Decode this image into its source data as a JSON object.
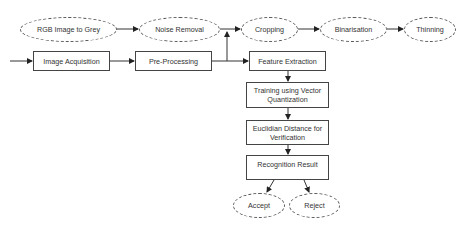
{
  "diagram": {
    "title": "",
    "preprocessing_steps": [
      {
        "id": "rgb",
        "label": "RGB Image to Grey"
      },
      {
        "id": "noise",
        "label": "Noise Removal"
      },
      {
        "id": "crop",
        "label": "Cropping"
      },
      {
        "id": "bin",
        "label": "Binarisation"
      },
      {
        "id": "thin",
        "label": "Thinning"
      }
    ],
    "main_flow": [
      {
        "id": "acq",
        "label": "Image Acquisition"
      },
      {
        "id": "pre",
        "label": "Pre-Processing"
      },
      {
        "id": "feat",
        "label": "Feature Extraction"
      },
      {
        "id": "train",
        "label": "Training using Vector Quantization"
      },
      {
        "id": "eucl",
        "label": "Euclidian Distance for Verification"
      },
      {
        "id": "result",
        "label": "Recognition Result"
      }
    ],
    "outcomes": [
      {
        "id": "accept",
        "label": "Accept"
      },
      {
        "id": "reject",
        "label": "Reject"
      }
    ],
    "edges": [
      [
        "input",
        "acq"
      ],
      [
        "acq",
        "pre"
      ],
      [
        "pre",
        "feat"
      ],
      [
        "pre",
        "noise"
      ],
      [
        "rgb",
        "noise"
      ],
      [
        "noise",
        "crop"
      ],
      [
        "crop",
        "bin"
      ],
      [
        "bin",
        "thin"
      ],
      [
        "feat",
        "train"
      ],
      [
        "train",
        "eucl"
      ],
      [
        "eucl",
        "result"
      ],
      [
        "result",
        "accept"
      ],
      [
        "result",
        "reject"
      ]
    ]
  }
}
